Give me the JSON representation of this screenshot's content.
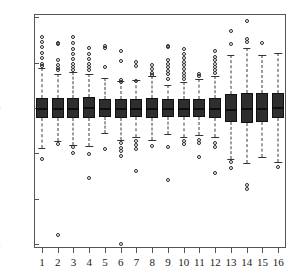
{
  "chart_data": {
    "type": "box",
    "title": "",
    "xlabel": "",
    "ylabel": "",
    "xlim": [
      0.5,
      16.5
    ],
    "ylim": [
      -3.2,
      2.1
    ],
    "grid": false,
    "legend": null,
    "yticks": [
      2,
      1,
      0,
      -1,
      -2,
      -3
    ],
    "ytick_labels": [
      "2",
      "1",
      "0",
      "-1",
      "-2",
      "-3"
    ],
    "xticks": [
      1,
      2,
      3,
      4,
      5,
      6,
      7,
      8,
      9,
      10,
      11,
      12,
      13,
      14,
      15,
      16
    ],
    "categories": [
      "1",
      "2",
      "3",
      "4",
      "5",
      "6",
      "7",
      "8",
      "9",
      "10",
      "11",
      "12",
      "13",
      "14",
      "15",
      "16"
    ],
    "box_style": {
      "fill": "#2e2e2e",
      "edge": "#111111",
      "median": "#0d0d0d",
      "whisker": "dashed",
      "outlier_marker": "open-circle"
    },
    "boxes": [
      {
        "category": "1",
        "q1": -0.22,
        "median": 0.0,
        "q3": 0.22,
        "whisker_low": -0.88,
        "whisker_high": 0.88,
        "outliers": [
          1.57,
          1.46,
          1.35,
          1.22,
          1.1,
          0.97,
          0.93,
          -1.12
        ]
      },
      {
        "category": "2",
        "q1": -0.21,
        "median": 0.01,
        "q3": 0.21,
        "whisker_low": -0.72,
        "whisker_high": 0.76,
        "outliers": [
          1.44,
          1.41,
          1.05,
          0.95,
          0.88,
          0.83,
          -0.79,
          -2.8
        ]
      },
      {
        "category": "3",
        "q1": -0.23,
        "median": 0.0,
        "q3": 0.23,
        "whisker_low": -0.82,
        "whisker_high": 0.79,
        "outliers": [
          1.56,
          1.44,
          1.31,
          1.2,
          1.09,
          0.98,
          0.9,
          0.84,
          -0.86,
          -1.0
        ]
      },
      {
        "category": "4",
        "q1": -0.23,
        "median": 0.02,
        "q3": 0.24,
        "whisker_low": -0.84,
        "whisker_high": 0.74,
        "outliers": [
          1.33,
          1.19,
          1.08,
          0.98,
          0.9,
          0.83,
          -1.02,
          -1.55
        ]
      },
      {
        "category": "5",
        "q1": -0.2,
        "median": 0.0,
        "q3": 0.2,
        "whisker_low": -0.56,
        "whisker_high": 0.66,
        "outliers": [
          1.36,
          1.33,
          0.9,
          -0.9
        ]
      },
      {
        "category": "6",
        "q1": -0.21,
        "median": -0.01,
        "q3": 0.2,
        "whisker_low": -0.7,
        "whisker_high": 0.59,
        "outliers": [
          1.26,
          1.03,
          0.62,
          0.58,
          -0.78,
          -0.88,
          -0.95,
          -1.05,
          -3.0
        ]
      },
      {
        "category": "7",
        "q1": -0.19,
        "median": 0.0,
        "q3": 0.19,
        "whisker_low": -0.63,
        "whisker_high": 0.61,
        "outliers": [
          1.01,
          0.92,
          0.6,
          -0.72,
          -0.82,
          -0.9,
          -1.4
        ]
      },
      {
        "category": "8",
        "q1": -0.21,
        "median": 0.0,
        "q3": 0.21,
        "whisker_low": -0.71,
        "whisker_high": 0.7,
        "outliers": [
          0.94,
          0.86,
          0.78,
          0.72,
          -0.84
        ]
      },
      {
        "category": "9",
        "q1": -0.19,
        "median": 0.0,
        "q3": 0.19,
        "whisker_low": -0.58,
        "whisker_high": 0.5,
        "outliers": [
          1.37,
          1.34,
          1.05,
          0.98,
          0.9,
          0.82,
          0.75,
          0.64,
          -0.86,
          -1.6
        ]
      },
      {
        "category": "10",
        "q1": -0.2,
        "median": 0.0,
        "q3": 0.2,
        "whisker_low": -0.63,
        "whisker_high": 0.58,
        "outliers": [
          1.3,
          1.19,
          1.11,
          1.02,
          0.94,
          0.86,
          0.78,
          0.7,
          0.63,
          -0.72,
          -0.8
        ]
      },
      {
        "category": "11",
        "q1": -0.2,
        "median": 0.0,
        "q3": 0.2,
        "whisker_low": -0.6,
        "whisker_high": 0.63,
        "outliers": [
          0.76,
          0.7,
          -0.7,
          -0.78,
          -1.08
        ]
      },
      {
        "category": "12",
        "q1": -0.21,
        "median": 0.0,
        "q3": 0.21,
        "whisker_low": -0.65,
        "whisker_high": 0.7,
        "outliers": [
          1.26,
          1.13,
          1.05,
          0.97,
          0.9,
          0.84,
          0.77,
          -0.78,
          -0.86,
          -1.43
        ]
      },
      {
        "category": "13",
        "q1": -0.3,
        "median": -0.02,
        "q3": 0.31,
        "whisker_low": -1.12,
        "whisker_high": 1.16,
        "outliers": [
          1.7,
          1.42,
          -1.2,
          -1.32
        ]
      },
      {
        "category": "14",
        "q1": -0.34,
        "median": 0.0,
        "q3": 0.33,
        "whisker_low": -1.22,
        "whisker_high": 1.33,
        "outliers": [
          1.91,
          1.52,
          1.45,
          -1.7,
          -1.78
        ]
      },
      {
        "category": "15",
        "q1": -0.32,
        "median": 0.0,
        "q3": 0.33,
        "whisker_low": -1.08,
        "whisker_high": 1.18,
        "outliers": [
          1.43
        ]
      },
      {
        "category": "16",
        "q1": -0.22,
        "median": 0.03,
        "q3": 0.33,
        "whisker_low": -1.2,
        "whisker_high": 1.22,
        "outliers": [
          -1.3
        ]
      }
    ]
  }
}
